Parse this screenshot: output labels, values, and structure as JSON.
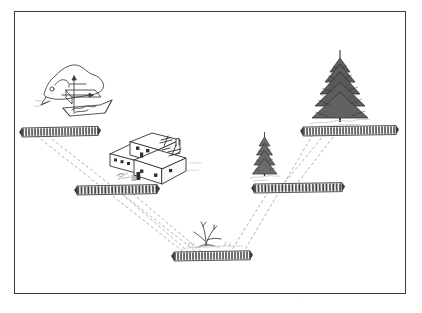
{
  "figure": {
    "kind": "line-drawing-diagram",
    "title": "Landscape intervisibility diagram",
    "frame": {
      "border_color": "#3a3a3a",
      "background": "#ffffff"
    },
    "ink_color": "#2b2b2b",
    "dash_color": "#9a9a9a",
    "faint_caption": "."
  },
  "symbols": {
    "hatched_bars": [
      {
        "id": "bar-upper-left",
        "label": "hatched-bar-upper-left",
        "x": 22,
        "y": 128,
        "width": 76,
        "height": 9,
        "tilt": -1.2
      },
      {
        "id": "bar-mid-left",
        "label": "hatched-bar-mid-left",
        "x": 77,
        "y": 186,
        "width": 80,
        "height": 9,
        "tilt": -1.0
      },
      {
        "id": "bar-bottom",
        "label": "hatched-bar-bottom",
        "x": 174,
        "y": 252,
        "width": 76,
        "height": 9,
        "tilt": -0.9
      },
      {
        "id": "bar-mid-right",
        "label": "hatched-bar-mid-right",
        "x": 254,
        "y": 184,
        "width": 88,
        "height": 9,
        "tilt": -0.9
      },
      {
        "id": "bar-upper-right",
        "label": "hatched-bar-upper-right",
        "x": 303,
        "y": 127,
        "width": 93,
        "height": 9,
        "tilt": -0.9
      }
    ],
    "features": [
      {
        "id": "terrain-sketch",
        "label": "terrain-block-sketch",
        "x": 40,
        "y": 62,
        "width": 72,
        "height": 58
      },
      {
        "id": "building",
        "label": "house-building",
        "x": 106,
        "y": 136,
        "width": 88,
        "height": 48
      },
      {
        "id": "tree-small",
        "label": "small-conifer-tree",
        "x": 250,
        "y": 136,
        "width": 30,
        "height": 46
      },
      {
        "id": "tree-large",
        "label": "large-conifer-tree",
        "x": 305,
        "y": 56,
        "width": 62,
        "height": 70
      },
      {
        "id": "shrub",
        "label": "shrub-stump",
        "x": 193,
        "y": 222,
        "width": 32,
        "height": 24
      }
    ],
    "sight_lines": [
      {
        "id": "line-1",
        "from": "bar-upper-left",
        "to": "bar-bottom",
        "x1": 37,
        "y1": 136,
        "x2": 186,
        "y2": 254
      },
      {
        "id": "line-2",
        "from": "bar-upper-left",
        "to": "bar-bottom",
        "x1": 48,
        "y1": 136,
        "x2": 199,
        "y2": 254
      },
      {
        "id": "line-3",
        "from": "bar-mid-left",
        "to": "bar-bottom",
        "x1": 122,
        "y1": 194,
        "x2": 190,
        "y2": 253
      },
      {
        "id": "line-4",
        "from": "bar-mid-left",
        "to": "bar-bottom",
        "x1": 133,
        "y1": 194,
        "x2": 203,
        "y2": 253
      },
      {
        "id": "line-5",
        "from": "bar-bottom",
        "to": "bar-mid-right",
        "x1": 230,
        "y1": 253,
        "x2": 268,
        "y2": 192
      },
      {
        "id": "line-6",
        "from": "bar-bottom",
        "to": "bar-upper-right",
        "x1": 243,
        "y1": 253,
        "x2": 312,
        "y2": 136
      },
      {
        "id": "line-7",
        "from": "bar-mid-right",
        "to": "bar-upper-right",
        "x1": 282,
        "y1": 186,
        "x2": 323,
        "y2": 136
      },
      {
        "id": "line-8",
        "from": "bar-mid-right",
        "to": "bar-upper-right",
        "x1": 295,
        "y1": 186,
        "x2": 334,
        "y2": 136
      }
    ]
  }
}
